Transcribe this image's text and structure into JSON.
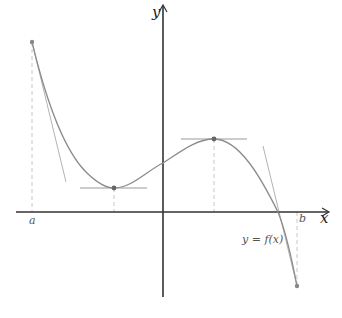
{
  "figure": {
    "type": "function-graph",
    "axes": {
      "x_label": "x",
      "y_label": "y",
      "origin_px": [
        163,
        212
      ],
      "x_range_px": [
        16,
        329
      ],
      "y_range_px": [
        5,
        297
      ]
    },
    "labels": {
      "a": "a",
      "b": "b",
      "function": "y = f(x)"
    },
    "points": {
      "a_point": [
        32,
        42
      ],
      "local_min": [
        114,
        188
      ],
      "local_max": [
        214,
        139
      ],
      "b_point": [
        297,
        286
      ]
    },
    "tangents": {
      "at_a": [
        [
          32,
          42
        ],
        [
          66,
          182
        ]
      ],
      "at_min": [
        [
          80,
          188
        ],
        [
          147,
          188
        ]
      ],
      "at_max": [
        [
          181,
          139
        ],
        [
          247,
          139
        ]
      ],
      "at_b": [
        [
          263,
          146
        ],
        [
          297,
          286
        ]
      ]
    },
    "colors": {
      "axis": "#333333",
      "curve": "#8c8c8c",
      "tangent": "#b3b3b3",
      "dash": "#c8c8c8",
      "point": "#777777"
    }
  }
}
